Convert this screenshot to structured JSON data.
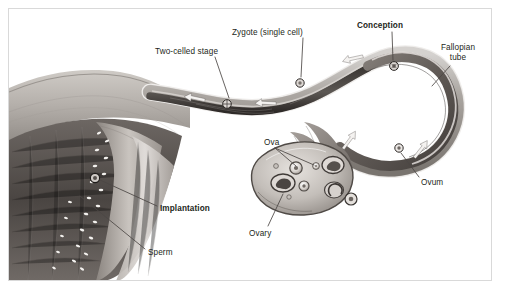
{
  "figure": {
    "background_color": "#ffffff",
    "frame_color": "#d9d9d9",
    "text_color": "#231f20",
    "style": "grayscale medical illustration"
  },
  "labels": [
    {
      "id": "two-celled-stage",
      "text": "Two-celled stage",
      "bold": false,
      "x": 155,
      "y": 47,
      "align": "left"
    },
    {
      "id": "zygote",
      "text": "Zygote (single cell)",
      "bold": false,
      "x": 232,
      "y": 28,
      "align": "left"
    },
    {
      "id": "conception",
      "text": "Conception",
      "bold": true,
      "x": 357,
      "y": 21,
      "align": "left"
    },
    {
      "id": "fallopian-tube",
      "text": "Fallopian tube",
      "bold": false,
      "x": 432,
      "y": 43,
      "align": "center",
      "width": 52
    },
    {
      "id": "ova",
      "text": "Ova",
      "bold": false,
      "x": 264,
      "y": 138,
      "align": "left"
    },
    {
      "id": "ovum",
      "text": "Ovum",
      "bold": false,
      "x": 421,
      "y": 178,
      "align": "left"
    },
    {
      "id": "ovary",
      "text": "Ovary",
      "bold": false,
      "x": 249,
      "y": 229,
      "align": "left"
    },
    {
      "id": "implantation",
      "text": "Implantation",
      "bold": true,
      "x": 160,
      "y": 204,
      "align": "left"
    },
    {
      "id": "sperm",
      "text": "Sperm",
      "bold": false,
      "x": 148,
      "y": 248,
      "align": "left"
    }
  ],
  "anatomy": {
    "uterus": "cut-away uterine body at left with endometrial lining",
    "fallopian_tube": "long tube curving right then hooking back in a U toward the ovary",
    "ovary": "oval organ with follicles at several maturation stages",
    "fimbriae": "finger-like projections at the tube's ovarian end"
  },
  "markers": [
    {
      "id": "conception-marker",
      "label": "Conception",
      "x": 394,
      "y": 66
    },
    {
      "id": "zygote-marker",
      "label": "Zygote (single cell)",
      "x": 300,
      "y": 83
    },
    {
      "id": "two-cell-marker",
      "label": "Two-celled stage",
      "x": 227,
      "y": 104
    },
    {
      "id": "implantation-marker",
      "label": "Implantation",
      "x": 95,
      "y": 178
    },
    {
      "id": "ovum-marker",
      "label": "Ovum",
      "x": 399,
      "y": 148
    }
  ],
  "flow_arrows": [
    {
      "id": "arrow-ovum-release",
      "direction": "up-right",
      "meaning": "ovum released from ovary into tube"
    },
    {
      "id": "arrow-toward-conception",
      "direction": "right",
      "meaning": "ovum travels toward conception site"
    },
    {
      "id": "arrow-return-1",
      "direction": "left",
      "meaning": "zygote travels back toward uterus"
    },
    {
      "id": "arrow-return-2",
      "direction": "left",
      "meaning": "embryo continues toward uterus"
    },
    {
      "id": "arrow-return-3",
      "direction": "left",
      "meaning": "embryo nears uterine cavity"
    }
  ]
}
